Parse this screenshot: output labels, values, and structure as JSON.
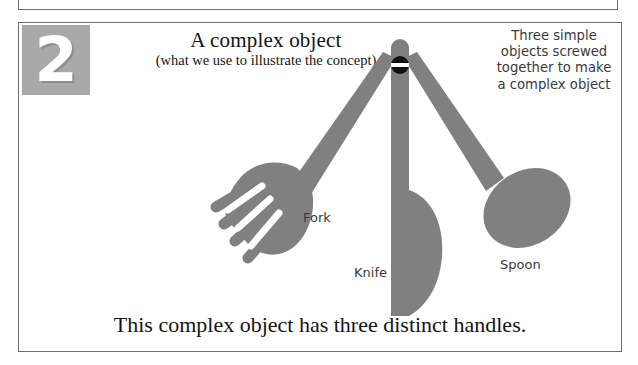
{
  "panel": {
    "number": "2",
    "title": "A complex object",
    "subtitle": "(what we use to illustrate the concept)",
    "annotation": "Three simple objects screwed together to make a complex object",
    "caption": "This complex object has three distinct handles.",
    "border_color": "#6e6e6e"
  },
  "figure": {
    "name": "three-utensil-swiss-army-diagram",
    "fill_color": "#808080",
    "screw_color": "#111111",
    "screw_slot_color": "#ffffff",
    "labels": {
      "fork": "Fork",
      "knife": "Knife",
      "spoon": "Spoon"
    }
  },
  "badge": {
    "background": "#a9a9a9",
    "text_color": "#ffffff"
  }
}
